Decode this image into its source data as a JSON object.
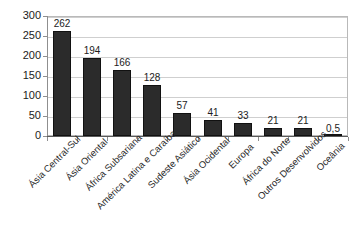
{
  "chart_data": {
    "type": "bar",
    "title": "",
    "subtitle": "",
    "xlabel": "",
    "ylabel": "",
    "categories": [
      "Ásia Central-Sul",
      "Ásia Oriental",
      "África Subsariana",
      "América Latina e Caraíbas",
      "Sudeste Asiático",
      "Ásia Ocidental",
      "Europa",
      "África do Norte",
      "Outros Desenvolvidos",
      "Oceânia"
    ],
    "values": [
      262,
      194,
      166,
      128,
      57,
      41,
      33,
      21,
      21,
      0.5
    ],
    "value_labels": [
      "262",
      "194",
      "166",
      "128",
      "57",
      "41",
      "33",
      "21",
      "21",
      "0,5"
    ],
    "ylim": [
      0,
      300
    ],
    "yticks": [
      0,
      50,
      100,
      150,
      200,
      250,
      300
    ],
    "ytick_labels": [
      "0",
      "50",
      "100",
      "150",
      "200",
      "250",
      "300"
    ],
    "grid": true,
    "legend": "none",
    "bar_color": "#2b2b2b",
    "grid_color": "#cfcfcf",
    "frame_color": "#b9b9b9",
    "background_color": "#ffffff"
  }
}
